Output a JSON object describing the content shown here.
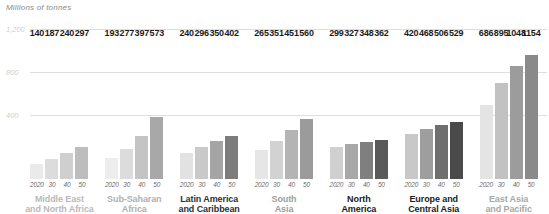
{
  "chart_data": {
    "type": "bar",
    "title": "",
    "subtitle": "",
    "ylabel": "Millions of tonnes",
    "xlabel": "",
    "ylim": [
      0,
      1300
    ],
    "grid": true,
    "gridlines": [
      400,
      800,
      1200
    ],
    "gridline_labels": [
      "400",
      "800",
      "1,200"
    ],
    "legend": "none",
    "x": [
      "2020",
      "30",
      "40",
      "50"
    ],
    "series_note": "Each region shows four bars for years 2020, 2030, 2040, 2050",
    "groups": [
      {
        "name": "Middle East\nand North Africa",
        "label_color": "#b9b9b9",
        "values": [
          140,
          187,
          240,
          297
        ]
      },
      {
        "name": "Sub-Saharan\nAfrica",
        "label_color": "#b0b0b0",
        "values": [
          193,
          277,
          397,
          573
        ]
      },
      {
        "name": "Latin America\nand Caribbean",
        "label_color": "#2f2f2f",
        "values": [
          240,
          296,
          350,
          402
        ]
      },
      {
        "name": "South\nAsia",
        "label_color": "#9d9d9d",
        "values": [
          265,
          351,
          451,
          560
        ]
      },
      {
        "name": "North\nAmerica",
        "label_color": "#1b1b1b",
        "values": [
          299,
          327,
          348,
          362
        ]
      },
      {
        "name": "Europe and\nCentral Asia",
        "label_color": "#1b1b1b",
        "values": [
          420,
          468,
          506,
          529
        ]
      },
      {
        "name": "East Asia\nand Pacific",
        "label_color": "#a7a7a7",
        "values": [
          686,
          895,
          1048,
          1154
        ]
      }
    ],
    "bar_colors": [
      "#e8e8e8",
      "#cdcdcd",
      "#9a9a9a",
      "#7d7d7d"
    ],
    "bar_colors_by_group": [
      [
        "#eaeaea",
        "#dcdcdc",
        "#cfcfcf",
        "#bdbdbd"
      ],
      [
        "#ededed",
        "#dcdcdc",
        "#c4c4c4",
        "#a8a8a8"
      ],
      [
        "#e2e2e2",
        "#c9c9c9",
        "#a5a5a5",
        "#7c7c7c"
      ],
      [
        "#e6e6e6",
        "#d2d2d2",
        "#b4b4b4",
        "#9b9b9b"
      ],
      [
        "#d0d0d0",
        "#a8a8a8",
        "#7f7f7f",
        "#5a5a5a"
      ],
      [
        "#c8c8c8",
        "#9e9e9e",
        "#6f6f6f",
        "#4a4a4a"
      ],
      [
        "#e4e4e4",
        "#c2c2c2",
        "#9c9c9c",
        "#8a8a8a"
      ]
    ]
  }
}
